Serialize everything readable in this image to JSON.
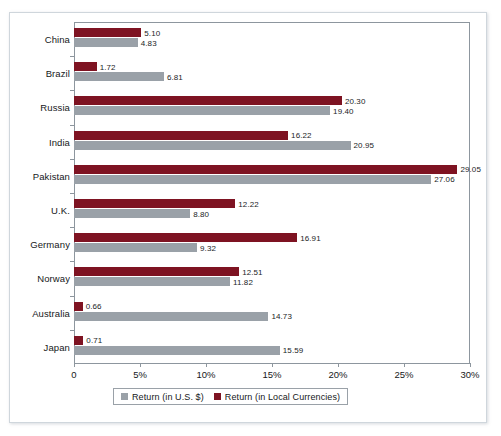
{
  "chart_data": {
    "type": "bar",
    "orientation": "horizontal",
    "title": "",
    "xlabel": "",
    "ylabel": "",
    "xlim": [
      0,
      30
    ],
    "xticks": [
      0,
      5,
      10,
      15,
      20,
      25,
      30
    ],
    "xtick_labels": [
      "0",
      "5%",
      "10%",
      "15%",
      "20%",
      "25%",
      "30%"
    ],
    "grid": false,
    "legend_position": "bottom",
    "categories": [
      "China",
      "Brazil",
      "Russia",
      "India",
      "Pakistan",
      "U.K.",
      "Germany",
      "Norway",
      "Australia",
      "Japan"
    ],
    "series": [
      {
        "name": "Return (in Local Currencies)",
        "color": "#7e1322",
        "values": [
          5.1,
          1.72,
          20.3,
          16.22,
          29.05,
          12.22,
          16.91,
          12.51,
          0.66,
          0.71
        ],
        "labels": [
          "5.10",
          "1.72",
          "20.30",
          "16.22",
          "29.05",
          "12.22",
          "16.91",
          "12.51",
          "0.66",
          "0.71"
        ]
      },
      {
        "name": "Return (in U.S. $)",
        "color": "#9aa1a8",
        "values": [
          4.83,
          6.81,
          19.4,
          20.95,
          27.06,
          8.8,
          9.32,
          11.82,
          14.73,
          15.59
        ],
        "labels": [
          "4.83",
          "6.81",
          "19.40",
          "20.95",
          "27.06",
          "8.80",
          "9.32",
          "11.82",
          "14.73",
          "15.59"
        ]
      }
    ]
  },
  "legend": {
    "items": [
      {
        "label": "Return (in U.S. $)",
        "color": "#9aa1a8"
      },
      {
        "label": "Return (in Local Currencies)",
        "color": "#7e1322"
      }
    ]
  },
  "colors": {
    "local_currency": "#7e1322",
    "us_dollar": "#9aa1a8",
    "axis": "#8d969e",
    "frame": "#cfd6dc",
    "text": "#16181a"
  }
}
